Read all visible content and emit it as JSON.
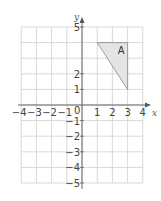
{
  "diagram": {
    "type": "coordinate-grid",
    "x_axis": {
      "label": "x",
      "min": -4,
      "max": 4,
      "ticks": [
        "-4",
        "-3",
        "-2",
        "-1",
        "1",
        "2",
        "3",
        "4"
      ]
    },
    "y_axis": {
      "label": "y",
      "min": -5,
      "max": 5,
      "ticks": [
        "5",
        "2",
        "1",
        "-1",
        "-2",
        "-3",
        "-4",
        "-5"
      ]
    },
    "origin_label": "0",
    "shapes": [
      {
        "label": "A",
        "type": "triangle",
        "vertices": [
          [
            1,
            4
          ],
          [
            3,
            4
          ],
          [
            3,
            1
          ]
        ],
        "fill": "#e4e4e4",
        "stroke": "#888888"
      }
    ],
    "colors": {
      "grid": "#cfcfcf",
      "axis": "#666666",
      "text": "#444444"
    }
  }
}
